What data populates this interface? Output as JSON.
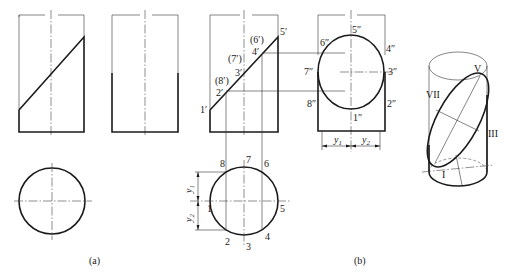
{
  "figure": {
    "captions": {
      "a": "(a)",
      "b": "(b)"
    },
    "front_view_labels": {
      "p1": "1′",
      "p2": "2′",
      "p8": "(8′)",
      "p3": "3′",
      "p7": "(7′)",
      "p4": "4′",
      "p6": "(6′)",
      "p5": "5′"
    },
    "side_view_labels": {
      "p5": "5″",
      "p6": "6″",
      "p4": "4″",
      "p7": "7″",
      "p3": "3″",
      "p8": "8″",
      "p2": "2″",
      "p1": "1″"
    },
    "top_view_labels": {
      "p1": "1",
      "p2": "2",
      "p3": "3",
      "p4": "4",
      "p5": "5",
      "p6": "6",
      "p7": "7",
      "p8": "8"
    },
    "dimensions": {
      "y1": "y",
      "y1_sub": "1",
      "y2": "y",
      "y2_sub": "2"
    },
    "iso_labels": {
      "I": "I",
      "III": "III",
      "V": "V",
      "VII": "VII"
    },
    "colors": {
      "line": "#1a1a1a",
      "background": "#ffffff"
    }
  }
}
